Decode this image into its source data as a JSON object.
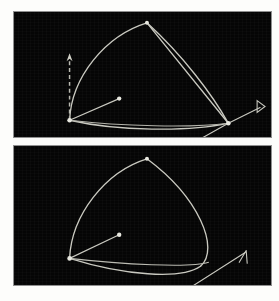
{
  "figure": {
    "title": "",
    "background_color": "#fdfdfb",
    "panel_background_color": "#050505",
    "panel_border_color": "#8f8f8f",
    "stroke_color": "#c9c9c0",
    "node_color": "#e8e8e0",
    "panel_count": 2
  },
  "panels": [
    {
      "id": "panel-top",
      "label": "top-panel",
      "has_dashed_axis": true,
      "has_arrow_marker": true,
      "arrow_marker_style": "open-triangle",
      "nodes": [
        {
          "name": "left-node",
          "x": 56,
          "y": 110,
          "r": 2.3
        },
        {
          "name": "apex-node",
          "x": 134,
          "y": 11,
          "r": 2.0
        },
        {
          "name": "right-node",
          "x": 216,
          "y": 113,
          "r": 2.3
        },
        {
          "name": "mid-dot",
          "x": 106,
          "y": 88,
          "r": 2.2
        },
        {
          "name": "lower-dot",
          "x": 186,
          "y": 130,
          "r": 2.2
        }
      ],
      "paths": [
        {
          "name": "outer-upper-arc",
          "d": "M 56 110 C 58 66, 92 24, 134 11"
        },
        {
          "name": "apex-right-edge",
          "d": "M 134 11 L 216 113"
        },
        {
          "name": "inner-right-arc",
          "d": "M 134 11 C 170 44, 200 84, 216 113"
        },
        {
          "name": "lower-sweep",
          "d": "M 56 110 C 104 121, 176 122, 216 113"
        },
        {
          "name": "lower-sweep-2",
          "d": "M 56 110 C 108 116, 178 118, 216 113"
        },
        {
          "name": "left-tangent",
          "d": "M 56 110 L 106 88"
        },
        {
          "name": "right-tangent",
          "d": "M 216 113 L 186 130"
        },
        {
          "name": "arrow-stem",
          "d": "M 216 113 L 248 97"
        }
      ],
      "dashed_axis": {
        "name": "vertical-dashed-axis",
        "x": 56,
        "y_top": 44,
        "y_bottom": 110
      },
      "arrow_marker": {
        "name": "open-triangle-marker",
        "x": 250,
        "y": 96
      }
    },
    {
      "id": "panel-bottom",
      "label": "bottom-panel",
      "has_dashed_axis": false,
      "has_arrow_marker": true,
      "arrow_marker_style": "line-arrowhead",
      "nodes": [
        {
          "name": "left-node",
          "x": 56,
          "y": 114,
          "r": 2.3
        },
        {
          "name": "apex-node",
          "x": 134,
          "y": 13,
          "r": 2.0
        },
        {
          "name": "lower-dot",
          "x": 106,
          "y": 90,
          "r": 2.2
        },
        {
          "name": "tail-dot",
          "x": 177,
          "y": 144,
          "r": 2.2
        }
      ],
      "paths": [
        {
          "name": "outer-upper-arc",
          "d": "M 56 114 C 58 70, 92 26, 134 13"
        },
        {
          "name": "right-lobe",
          "d": "M 134 13 C 186 52, 208 104, 188 122"
        },
        {
          "name": "right-lobe-return",
          "d": "M 188 122 C 168 136, 110 131, 56 114"
        },
        {
          "name": "lower-sweep",
          "d": "M 56 114 C 108 120, 178 124, 196 118"
        },
        {
          "name": "left-tangent",
          "d": "M 56 114 L 106 90"
        },
        {
          "name": "arrow-stem",
          "d": "M 177 144 L 233 108"
        }
      ],
      "arrow_marker": {
        "name": "line-arrowhead-marker",
        "x": 234,
        "y": 107
      }
    }
  ]
}
